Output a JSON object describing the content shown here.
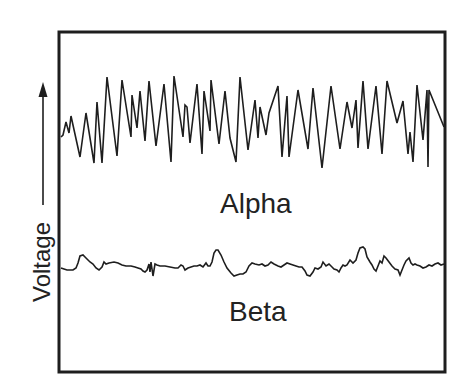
{
  "diagram": {
    "labels": {
      "alpha": "Alpha",
      "beta": "Beta",
      "y_axis": "Voltage"
    },
    "colors": {
      "line": "#1e1e1e",
      "background": "#ffffff"
    },
    "frame": {
      "x": 59,
      "y": 32,
      "width": 386,
      "height": 340
    },
    "y_arrow": {
      "x": 43,
      "y_tip": 82,
      "y_tail": 205
    },
    "waves": {
      "alpha": [
        [
          61,
          137
        ],
        [
          63,
          135
        ],
        [
          66,
          122
        ],
        [
          69,
          133
        ],
        [
          71,
          116
        ],
        [
          80,
          157
        ],
        [
          86,
          113
        ],
        [
          94,
          163
        ],
        [
          97,
          102
        ],
        [
          102,
          163
        ],
        [
          107,
          77
        ],
        [
          117,
          156
        ],
        [
          122,
          80
        ],
        [
          131,
          137
        ],
        [
          132,
          95
        ],
        [
          137,
          128
        ],
        [
          140,
          91
        ],
        [
          145,
          141
        ],
        [
          149,
          81
        ],
        [
          156,
          146
        ],
        [
          164,
          84
        ],
        [
          171,
          162
        ],
        [
          174,
          76
        ],
        [
          183,
          137
        ],
        [
          185,
          105
        ],
        [
          187,
          107
        ],
        [
          190,
          143
        ],
        [
          197,
          84
        ],
        [
          202,
          154
        ],
        [
          204,
          91
        ],
        [
          210,
          131
        ],
        [
          211,
          80
        ],
        [
          219,
          144
        ],
        [
          225,
          91
        ],
        [
          230,
          138
        ],
        [
          236,
          162
        ],
        [
          240,
          77
        ],
        [
          248,
          150
        ],
        [
          255,
          100
        ],
        [
          258,
          138
        ],
        [
          260,
          107
        ],
        [
          266,
          135
        ],
        [
          269,
          113
        ],
        [
          278,
          86
        ],
        [
          282,
          157
        ],
        [
          287,
          96
        ],
        [
          289,
          157
        ],
        [
          298,
          90
        ],
        [
          308,
          149
        ],
        [
          313,
          88
        ],
        [
          322,
          168
        ],
        [
          331,
          86
        ],
        [
          340,
          149
        ],
        [
          347,
          102
        ],
        [
          352,
          128
        ],
        [
          356,
          100
        ],
        [
          358,
          148
        ],
        [
          363,
          81
        ],
        [
          368,
          149
        ],
        [
          376,
          86
        ],
        [
          382,
          154
        ],
        [
          387,
          81
        ],
        [
          397,
          123
        ],
        [
          403,
          101
        ],
        [
          408,
          154
        ],
        [
          410,
          132
        ],
        [
          413,
          162
        ],
        [
          417,
          85
        ],
        [
          423,
          140
        ],
        [
          427,
          90
        ],
        [
          428,
          167
        ],
        [
          429,
          90
        ],
        [
          444,
          127
        ]
      ],
      "beta": [
        [
          61,
          268
        ],
        [
          64,
          269
        ],
        [
          67,
          270
        ],
        [
          70,
          270
        ],
        [
          73,
          270
        ],
        [
          76,
          268
        ],
        [
          78,
          263
        ],
        [
          80,
          256
        ],
        [
          83,
          255
        ],
        [
          86,
          258
        ],
        [
          90,
          262
        ],
        [
          93,
          264
        ],
        [
          96,
          268
        ],
        [
          99,
          270
        ],
        [
          102,
          267
        ],
        [
          104,
          262
        ],
        [
          106,
          264
        ],
        [
          109,
          263
        ],
        [
          114,
          262
        ],
        [
          118,
          263
        ],
        [
          122,
          265
        ],
        [
          126,
          266
        ],
        [
          131,
          266
        ],
        [
          135,
          267
        ],
        [
          138,
          268
        ],
        [
          141,
          269
        ],
        [
          143,
          271
        ],
        [
          145,
          272
        ],
        [
          147,
          270
        ],
        [
          149,
          264
        ],
        [
          150,
          272
        ],
        [
          151,
          262
        ],
        [
          153,
          276
        ],
        [
          155,
          264
        ],
        [
          157,
          265
        ],
        [
          160,
          266
        ],
        [
          165,
          266
        ],
        [
          170,
          267
        ],
        [
          175,
          268
        ],
        [
          178,
          268
        ],
        [
          181,
          265
        ],
        [
          183,
          266
        ],
        [
          185,
          270
        ],
        [
          188,
          268
        ],
        [
          191,
          267
        ],
        [
          194,
          266
        ],
        [
          197,
          266
        ],
        [
          200,
          265
        ],
        [
          203,
          267
        ],
        [
          206,
          263
        ],
        [
          208,
          266
        ],
        [
          210,
          266
        ],
        [
          212,
          262
        ],
        [
          214,
          253
        ],
        [
          216,
          250
        ],
        [
          218,
          250
        ],
        [
          221,
          255
        ],
        [
          224,
          262
        ],
        [
          227,
          268
        ],
        [
          231,
          273
        ],
        [
          234,
          276
        ],
        [
          237,
          275
        ],
        [
          240,
          274
        ],
        [
          243,
          274
        ],
        [
          246,
          272
        ],
        [
          249,
          266
        ],
        [
          252,
          263
        ],
        [
          255,
          264
        ],
        [
          259,
          265
        ],
        [
          262,
          264
        ],
        [
          265,
          266
        ],
        [
          268,
          265
        ],
        [
          271,
          262
        ],
        [
          274,
          264
        ],
        [
          278,
          266
        ],
        [
          281,
          267
        ],
        [
          284,
          265
        ],
        [
          287,
          263
        ],
        [
          290,
          264
        ],
        [
          293,
          265
        ],
        [
          296,
          266
        ],
        [
          299,
          267
        ],
        [
          302,
          267
        ],
        [
          305,
          271
        ],
        [
          307,
          275
        ],
        [
          310,
          276
        ],
        [
          313,
          272
        ],
        [
          315,
          268
        ],
        [
          318,
          269
        ],
        [
          321,
          267
        ],
        [
          323,
          262
        ],
        [
          326,
          266
        ],
        [
          329,
          264
        ],
        [
          332,
          267
        ],
        [
          334,
          269
        ],
        [
          337,
          270
        ],
        [
          339,
          272
        ],
        [
          341,
          268
        ],
        [
          343,
          265
        ],
        [
          345,
          266
        ],
        [
          347,
          265
        ],
        [
          350,
          260
        ],
        [
          353,
          263
        ],
        [
          356,
          260
        ],
        [
          358,
          253
        ],
        [
          360,
          248
        ],
        [
          363,
          247
        ],
        [
          365,
          249
        ],
        [
          367,
          257
        ],
        [
          370,
          262
        ],
        [
          372,
          265
        ],
        [
          374,
          269
        ],
        [
          376,
          271
        ],
        [
          378,
          266
        ],
        [
          380,
          261
        ],
        [
          382,
          263
        ],
        [
          384,
          256
        ],
        [
          386,
          258
        ],
        [
          389,
          262
        ],
        [
          392,
          266
        ],
        [
          395,
          269
        ],
        [
          398,
          270
        ],
        [
          400,
          275
        ],
        [
          402,
          270
        ],
        [
          404,
          265
        ],
        [
          406,
          261
        ],
        [
          409,
          258
        ],
        [
          411,
          263
        ],
        [
          413,
          265
        ],
        [
          415,
          264
        ],
        [
          417,
          265
        ],
        [
          420,
          266
        ],
        [
          423,
          268
        ],
        [
          426,
          267
        ],
        [
          429,
          265
        ],
        [
          432,
          266
        ],
        [
          435,
          264
        ],
        [
          438,
          263
        ],
        [
          441,
          265
        ],
        [
          444,
          264
        ]
      ]
    }
  }
}
